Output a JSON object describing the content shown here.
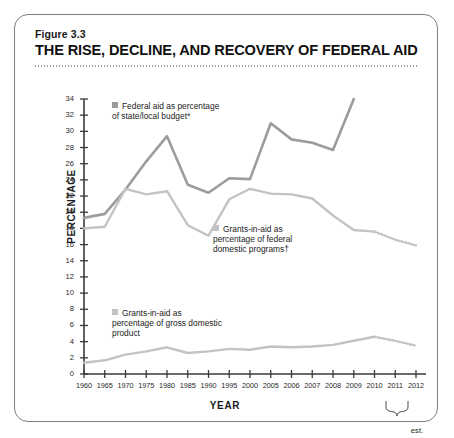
{
  "figure": {
    "number": "Figure 3.3",
    "title": "THE RISE, DECLINE, AND RECOVERY OF FEDERAL AID"
  },
  "axis": {
    "ylabel": "PERCENTAGE",
    "xlabel": "YEAR",
    "est_note": "est."
  },
  "legend": {
    "budget": "Federal aid as percentage of state/local budget*",
    "federal": "Grants-in-aid as percentage of federal domestic programs†",
    "gdp": "Grants-in-aid as percentage of gross domestic product"
  },
  "colors": {
    "series_budget": "#9c9c9c",
    "series_federal": "#c3c3c3",
    "series_gdp": "#c3c3c3",
    "axis": "#3a3a3a",
    "card_border": "#7e7e7e",
    "title": "#111111"
  },
  "chart_data": {
    "type": "line",
    "title": "THE RISE, DECLINE, AND RECOVERY OF FEDERAL AID",
    "subtitle": "Figure 3.3",
    "xlabel": "YEAR",
    "ylabel": "PERCENTAGE",
    "grid": false,
    "legend_position": "inside-plot",
    "ylim": [
      0,
      34
    ],
    "yticks": [
      0,
      2,
      4,
      6,
      8,
      10,
      12,
      14,
      16,
      18,
      20,
      22,
      24,
      26,
      28,
      30,
      32,
      34
    ],
    "categories": [
      "1960",
      "1965",
      "1970",
      "1975",
      "1980",
      "1985",
      "1990",
      "1995",
      "2000",
      "2005",
      "2006",
      "2007",
      "2008",
      "2009",
      "2010",
      "2011",
      "2012"
    ],
    "estimated_categories": [
      "2010",
      "2011",
      "2012"
    ],
    "series": [
      {
        "name": "Federal aid as percentage of state/local budget*",
        "color": "#9c9c9c",
        "style": "solid",
        "values": [
          19.3,
          19.8,
          22.8,
          26.3,
          29.4,
          23.4,
          22.4,
          24.2,
          24.1,
          31.0,
          29.0,
          28.6,
          27.7,
          34.0,
          null,
          null,
          null
        ]
      },
      {
        "name": "Grants-in-aid as percentage of federal domestic programs†",
        "color": "#c3c3c3",
        "style": "solid-then-dotted",
        "values": [
          18.0,
          18.2,
          22.9,
          22.2,
          22.6,
          18.4,
          17.1,
          21.6,
          22.9,
          22.3,
          22.2,
          21.7,
          19.6,
          17.8,
          17.6,
          16.6,
          15.9
        ]
      },
      {
        "name": "Grants-in-aid as percentage of gross domestic product",
        "color": "#c3c3c3",
        "style": "solid-then-dotted",
        "values": [
          1.4,
          1.7,
          2.4,
          2.8,
          3.3,
          2.6,
          2.8,
          3.1,
          3.0,
          3.4,
          3.3,
          3.4,
          3.6,
          4.1,
          4.6,
          4.1,
          3.5
        ]
      }
    ]
  }
}
